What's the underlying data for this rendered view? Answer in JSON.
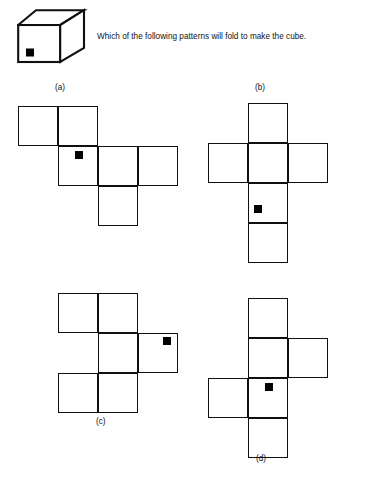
{
  "header": {
    "question": "Which of the following patterns will fold to make the cube.",
    "cube_icon": "cube-3d-icon",
    "cube_mark": "black-square-mark"
  },
  "geometry": {
    "cell_size": 40,
    "dot_size": 8,
    "stroke_color": "#101010",
    "dot_color": "#000000",
    "background": "#ffffff"
  },
  "patterns": [
    {
      "id": "a",
      "label": "(a)",
      "cells": [
        {
          "row": 0,
          "col": 0
        },
        {
          "row": 0,
          "col": 1
        },
        {
          "row": 1,
          "col": 1
        },
        {
          "row": 1,
          "col": 2
        },
        {
          "row": 1,
          "col": 3
        },
        {
          "row": 2,
          "col": 2
        }
      ],
      "dot": {
        "row": 1,
        "col": 1,
        "offset_x": 0.42,
        "offset_y": 0.12
      }
    },
    {
      "id": "b",
      "label": "(b)",
      "cells": [
        {
          "row": 0,
          "col": 1
        },
        {
          "row": 1,
          "col": 0
        },
        {
          "row": 1,
          "col": 1
        },
        {
          "row": 1,
          "col": 2
        },
        {
          "row": 2,
          "col": 1
        },
        {
          "row": 3,
          "col": 1
        }
      ],
      "dot": {
        "row": 2,
        "col": 1,
        "offset_x": 0.16,
        "offset_y": 0.55
      }
    },
    {
      "id": "c",
      "label": "(c)",
      "cells": [
        {
          "row": 0,
          "col": 0
        },
        {
          "row": 0,
          "col": 1
        },
        {
          "row": 1,
          "col": 1
        },
        {
          "row": 1,
          "col": 2
        },
        {
          "row": 2,
          "col": 0
        },
        {
          "row": 2,
          "col": 1
        }
      ],
      "dot": {
        "row": 1,
        "col": 2,
        "offset_x": 0.62,
        "offset_y": 0.1
      }
    },
    {
      "id": "d",
      "label": "(d)",
      "cells": [
        {
          "row": 0,
          "col": 1
        },
        {
          "row": 1,
          "col": 1
        },
        {
          "row": 1,
          "col": 2
        },
        {
          "row": 2,
          "col": 0
        },
        {
          "row": 2,
          "col": 1
        },
        {
          "row": 3,
          "col": 1
        }
      ],
      "dot": {
        "row": 2,
        "col": 1,
        "offset_x": 0.42,
        "offset_y": 0.12
      }
    }
  ]
}
